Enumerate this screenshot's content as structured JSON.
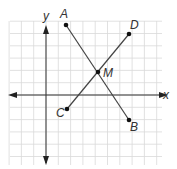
{
  "diagram": {
    "type": "coordinate-plane",
    "axes": {
      "x_label": "x",
      "y_label": "y"
    },
    "colors": {
      "grid": "#d9d9d9",
      "axis": "#333333",
      "segment": "#444444",
      "point": "#111111"
    },
    "points": [
      {
        "name": "A",
        "px": 66,
        "py": 25
      },
      {
        "name": "B",
        "px": 129,
        "py": 120
      },
      {
        "name": "C",
        "px": 67,
        "py": 109
      },
      {
        "name": "D",
        "px": 129,
        "py": 34
      },
      {
        "name": "M",
        "px": 98,
        "py": 72
      }
    ],
    "segments": [
      {
        "from": "A",
        "to": "B"
      },
      {
        "from": "C",
        "to": "D"
      }
    ],
    "note": "M is the intersection (midpoint) of segments AB and CD"
  }
}
